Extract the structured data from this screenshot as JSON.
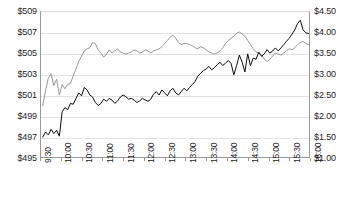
{
  "chart_data": {
    "type": "line",
    "title": "",
    "xlabel": "",
    "ylabel": "",
    "grid": true,
    "legend": "none",
    "x_tick_labels": [
      "9:30",
      "10:00",
      "10:30",
      "11:00",
      "11:30",
      "12:00",
      "12:30",
      "13:00",
      "13:30",
      "14:00",
      "14:30",
      "15:00",
      "15:30",
      "16:00"
    ],
    "axes": {
      "left": {
        "label": "",
        "ylim": [
          495,
          509
        ],
        "tick_step": 2,
        "tick_labels": [
          "$495",
          "$497",
          "$499",
          "$501",
          "$503",
          "$505",
          "$507",
          "$509"
        ],
        "tick_values": [
          495,
          497,
          499,
          501,
          503,
          505,
          507,
          509
        ]
      },
      "right": {
        "label": "",
        "ylim": [
          1.0,
          4.5
        ],
        "tick_step": 0.5,
        "tick_labels": [
          "$1.00",
          "$1.50",
          "$2.00",
          "$2.50",
          "$3.00",
          "$3.50",
          "$4.00",
          "$4.50"
        ],
        "tick_values": [
          1.0,
          1.5,
          2.0,
          2.5,
          3.0,
          3.5,
          4.0,
          4.5
        ]
      }
    },
    "series": [
      {
        "name": "stock-price",
        "axis": "left",
        "color": "#8d8d8d",
        "x": [
          "9:34",
          "9:38",
          "9:42",
          "9:46",
          "9:50",
          "9:54",
          "9:58",
          "10:02",
          "10:06",
          "10:10",
          "10:14",
          "10:18",
          "10:22",
          "10:26",
          "10:30",
          "10:34",
          "10:38",
          "10:42",
          "10:46",
          "10:50",
          "10:54",
          "10:58",
          "11:02",
          "11:06",
          "11:10",
          "11:14",
          "11:18",
          "11:22",
          "11:26",
          "11:30",
          "11:34",
          "11:38",
          "11:42",
          "11:46",
          "11:50",
          "11:54",
          "11:58",
          "12:02",
          "12:06",
          "12:10",
          "12:14",
          "12:18",
          "12:22",
          "12:26",
          "12:30",
          "12:34",
          "12:38",
          "12:42",
          "12:46",
          "12:50",
          "12:54",
          "12:58",
          "13:02",
          "13:06",
          "13:10",
          "13:14",
          "13:18",
          "13:22",
          "13:26",
          "13:30",
          "13:34",
          "13:38",
          "13:42",
          "13:46",
          "13:50",
          "13:54",
          "13:58",
          "14:02",
          "14:06",
          "14:10",
          "14:14",
          "14:18",
          "14:22",
          "14:26",
          "14:30",
          "14:34",
          "14:38",
          "14:42",
          "14:46",
          "14:50",
          "14:54",
          "14:58",
          "15:02",
          "15:06",
          "15:10",
          "15:14",
          "15:18",
          "15:22",
          "15:26",
          "15:30",
          "15:34",
          "15:38",
          "15:42",
          "15:46",
          "15:50",
          "15:54",
          "15:58"
        ],
        "values": [
          500.0,
          501.4,
          502.6,
          503.0,
          501.9,
          502.5,
          501.0,
          502.0,
          501.6,
          502.0,
          502.1,
          502.8,
          503.5,
          504.2,
          504.7,
          505.2,
          505.4,
          505.5,
          506.0,
          505.9,
          505.3,
          505.0,
          504.6,
          504.9,
          505.3,
          505.0,
          505.2,
          505.4,
          505.1,
          505.0,
          504.9,
          505.0,
          505.1,
          505.3,
          505.2,
          505.0,
          505.1,
          505.3,
          505.2,
          505.0,
          505.2,
          505.3,
          505.4,
          505.6,
          505.9,
          506.2,
          506.5,
          506.7,
          506.4,
          506.0,
          505.8,
          505.9,
          505.9,
          505.8,
          505.7,
          505.5,
          505.4,
          505.6,
          505.5,
          505.3,
          505.1,
          505.0,
          504.9,
          505.0,
          505.2,
          505.5,
          505.9,
          506.2,
          506.4,
          506.6,
          506.9,
          507.0,
          506.8,
          506.6,
          506.2,
          505.8,
          505.4,
          505.1,
          505.0,
          504.8,
          504.4,
          504.2,
          504.4,
          504.7,
          505.0,
          504.9,
          504.8,
          505.0,
          505.2,
          505.4,
          505.3,
          505.5,
          505.8,
          506.0,
          506.1,
          505.9,
          505.8
        ]
      },
      {
        "name": "option-price",
        "axis": "right",
        "color": "#0d0d0d",
        "x": [
          "9:34",
          "9:38",
          "9:42",
          "9:46",
          "9:50",
          "9:54",
          "9:58",
          "10:02",
          "10:06",
          "10:10",
          "10:14",
          "10:18",
          "10:22",
          "10:26",
          "10:30",
          "10:34",
          "10:38",
          "10:42",
          "10:46",
          "10:50",
          "10:54",
          "10:58",
          "11:02",
          "11:06",
          "11:10",
          "11:14",
          "11:18",
          "11:22",
          "11:26",
          "11:30",
          "11:34",
          "11:38",
          "11:42",
          "11:46",
          "11:50",
          "11:54",
          "11:58",
          "12:02",
          "12:06",
          "12:10",
          "12:14",
          "12:18",
          "12:22",
          "12:26",
          "12:30",
          "12:34",
          "12:38",
          "12:42",
          "12:46",
          "12:50",
          "12:54",
          "12:58",
          "13:02",
          "13:06",
          "13:10",
          "13:14",
          "13:18",
          "13:22",
          "13:26",
          "13:30",
          "13:34",
          "13:38",
          "13:42",
          "13:46",
          "13:50",
          "13:54",
          "13:58",
          "14:02",
          "14:06",
          "14:10",
          "14:14",
          "14:18",
          "14:22",
          "14:26",
          "14:30",
          "14:34",
          "14:38",
          "14:42",
          "14:46",
          "14:50",
          "14:54",
          "14:58",
          "15:02",
          "15:06",
          "15:10",
          "15:14",
          "15:18",
          "15:22",
          "15:26",
          "15:30",
          "15:34",
          "15:38",
          "15:42",
          "15:46",
          "15:50",
          "15:54",
          "15:58"
        ],
        "values": [
          1.5,
          1.62,
          1.55,
          1.68,
          1.58,
          1.66,
          1.52,
          2.1,
          2.2,
          2.15,
          2.3,
          2.28,
          2.42,
          2.55,
          2.48,
          2.68,
          2.62,
          2.5,
          2.45,
          2.32,
          2.25,
          2.3,
          2.4,
          2.35,
          2.42,
          2.38,
          2.3,
          2.36,
          2.45,
          2.5,
          2.46,
          2.4,
          2.42,
          2.38,
          2.32,
          2.36,
          2.42,
          2.38,
          2.35,
          2.4,
          2.52,
          2.58,
          2.5,
          2.62,
          2.55,
          2.48,
          2.6,
          2.66,
          2.55,
          2.5,
          2.58,
          2.66,
          2.6,
          2.68,
          2.75,
          2.82,
          2.95,
          3.02,
          3.08,
          3.12,
          3.18,
          3.1,
          3.15,
          3.22,
          3.28,
          3.2,
          3.26,
          3.32,
          3.25,
          2.98,
          3.2,
          3.45,
          3.28,
          3.05,
          3.48,
          3.2,
          3.38,
          3.35,
          3.52,
          3.42,
          3.48,
          3.58,
          3.5,
          3.55,
          3.62,
          3.55,
          3.62,
          3.7,
          3.78,
          3.85,
          3.95,
          4.05,
          4.2,
          4.28,
          4.05,
          3.98,
          3.96
        ]
      }
    ]
  }
}
